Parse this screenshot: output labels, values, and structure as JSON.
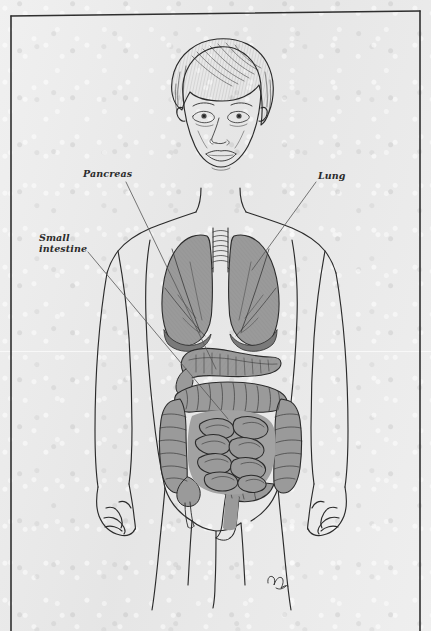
{
  "page": {
    "kind": "scanned-book-illustration",
    "medium": "pen-and-ink line drawing with gray wash",
    "paper_color": "#e8e8e8",
    "ink_color": "#2b2b2b",
    "organ_fill_color": "#9a9a9a",
    "organ_fill_color_dark": "#888888",
    "leader_line_color": "#555555"
  },
  "frame": {
    "present": true,
    "sides": [
      "top",
      "left",
      "right"
    ],
    "bottom_open": true,
    "color": "#2f2f2f",
    "inset_px": 10
  },
  "labels": [
    {
      "id": "pancreas",
      "text": "Pancreas",
      "style": "bold-italic-serif",
      "leader_from": [
        126,
        182
      ],
      "leader_to": [
        216,
        369
      ]
    },
    {
      "id": "lung",
      "text": "Lung",
      "style": "bold-italic-serif",
      "leader_from": [
        316,
        182
      ],
      "leader_to": [
        252,
        270
      ]
    },
    {
      "id": "small_intestine",
      "text": "Small\nintestine",
      "style": "bold-italic-serif",
      "leader_from": [
        88,
        252
      ],
      "leader_to": [
        228,
        419
      ]
    }
  ],
  "figure": {
    "hair": "short bob haircut with fringe",
    "pose": "standing, arms at sides, frontal view",
    "visible_organs": [
      "trachea",
      "left lung",
      "right lung",
      "pancreas",
      "small intestine",
      "large intestine",
      "appendix",
      "rectum"
    ]
  },
  "signature": {
    "present": true,
    "text": "ℳ",
    "description": "artist monogram in lower right of the figure area",
    "position": [
      274,
      578
    ]
  }
}
